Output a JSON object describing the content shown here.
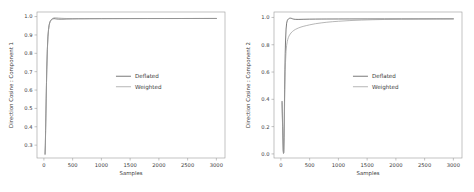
{
  "figure": {
    "background": "#ffffff",
    "panel_count": 2
  },
  "chart_data": [
    {
      "type": "line",
      "title": "",
      "xlabel": "Samples",
      "ylabel": "Direction Cosine : Component 1",
      "xlim": [
        -120,
        3150
      ],
      "ylim": [
        0.23,
        1.025
      ],
      "xticks": [
        0,
        500,
        1000,
        1500,
        2000,
        2500,
        3000
      ],
      "xticklabels": [
        "0",
        "500",
        "1000",
        "1500",
        "2000",
        "2500",
        "3000"
      ],
      "yticks": [
        0.3,
        0.4,
        0.5,
        0.6,
        0.7,
        0.8,
        0.9,
        1.0
      ],
      "yticklabels": [
        "0.3",
        "0.4",
        "0.5",
        "0.6",
        "0.7",
        "0.8",
        "0.9",
        "1.0"
      ],
      "grid": false,
      "legend_position": "center",
      "series": [
        {
          "name": "Deflated",
          "color": "#4d4d4d",
          "x": [
            20,
            25,
            30,
            35,
            40,
            45,
            50,
            60,
            70,
            80,
            90,
            100,
            110,
            120,
            130,
            140,
            150,
            175,
            200,
            225,
            250,
            300,
            350,
            400,
            500,
            600,
            700,
            800,
            1000,
            1200,
            1500,
            1800,
            2100,
            2400,
            2700,
            3000
          ],
          "y": [
            0.252,
            0.3,
            0.381,
            0.47,
            0.556,
            0.64,
            0.714,
            0.822,
            0.89,
            0.929,
            0.952,
            0.966,
            0.974,
            0.979,
            0.983,
            0.985,
            0.987,
            0.989,
            0.988,
            0.987,
            0.9865,
            0.9862,
            0.9865,
            0.987,
            0.9875,
            0.988,
            0.9882,
            0.9885,
            0.9888,
            0.989,
            0.9892,
            0.9894,
            0.9895,
            0.9896,
            0.9897,
            0.9898
          ]
        },
        {
          "name": "Weighted",
          "color": "#9e9e9e",
          "x": [
            20,
            25,
            30,
            35,
            40,
            45,
            50,
            60,
            70,
            80,
            90,
            100,
            110,
            120,
            130,
            140,
            150,
            175,
            200,
            225,
            250,
            300,
            350,
            400,
            500,
            600,
            700,
            800,
            1000,
            1200,
            1500,
            1800,
            2100,
            2400,
            2700,
            3000
          ],
          "y": [
            0.248,
            0.296,
            0.376,
            0.464,
            0.55,
            0.634,
            0.708,
            0.817,
            0.886,
            0.926,
            0.95,
            0.964,
            0.973,
            0.979,
            0.984,
            0.987,
            0.99,
            0.993,
            0.9935,
            0.993,
            0.992,
            0.9908,
            0.99,
            0.9896,
            0.9892,
            0.989,
            0.9889,
            0.9889,
            0.989,
            0.9891,
            0.9893,
            0.9894,
            0.9895,
            0.9896,
            0.9897,
            0.9898
          ]
        }
      ]
    },
    {
      "type": "line",
      "title": "",
      "xlabel": "Samples",
      "ylabel": "Direction Cosine : Component 2",
      "xlim": [
        -120,
        3150
      ],
      "ylim": [
        -0.03,
        1.04
      ],
      "xticks": [
        0,
        500,
        1000,
        1500,
        2000,
        2500,
        3000
      ],
      "xticklabels": [
        "0",
        "500",
        "1000",
        "1500",
        "2000",
        "2500",
        "3000"
      ],
      "yticks": [
        0.0,
        0.2,
        0.4,
        0.6,
        0.8,
        1.0
      ],
      "yticklabels": [
        "0.0",
        "0.2",
        "0.4",
        "0.6",
        "0.8",
        "1.0"
      ],
      "grid": false,
      "legend_position": "center",
      "series": [
        {
          "name": "Deflated",
          "color": "#4d4d4d",
          "x": [
            20,
            30,
            40,
            45,
            50,
            55,
            60,
            65,
            70,
            75,
            80,
            90,
            100,
            110,
            120,
            130,
            140,
            150,
            165,
            180,
            200,
            225,
            250,
            300,
            350,
            400,
            500,
            600,
            700,
            800,
            1000,
            1200,
            1500,
            1800,
            2100,
            2400,
            2700,
            3000
          ],
          "y": [
            0.385,
            0.2,
            0.03,
            0.005,
            0.012,
            0.12,
            0.3,
            0.47,
            0.62,
            0.735,
            0.82,
            0.915,
            0.958,
            0.976,
            0.984,
            0.989,
            0.992,
            0.994,
            0.9948,
            0.9938,
            0.9905,
            0.9875,
            0.9862,
            0.9858,
            0.9862,
            0.9868,
            0.9876,
            0.9881,
            0.9884,
            0.9886,
            0.9889,
            0.9891,
            0.9893,
            0.9894,
            0.9895,
            0.9896,
            0.9897,
            0.9898
          ]
        },
        {
          "name": "Weighted",
          "color": "#9e9e9e",
          "x": [
            20,
            30,
            40,
            45,
            50,
            55,
            60,
            65,
            70,
            75,
            80,
            90,
            100,
            110,
            120,
            130,
            140,
            150,
            175,
            200,
            225,
            250,
            300,
            350,
            400,
            450,
            500,
            600,
            700,
            800,
            900,
            1000,
            1200,
            1400,
            1600,
            1800,
            2100,
            2400,
            2700,
            3000
          ],
          "y": [
            0.375,
            0.19,
            0.022,
            0.002,
            0.008,
            0.095,
            0.245,
            0.39,
            0.51,
            0.605,
            0.672,
            0.752,
            0.796,
            0.822,
            0.84,
            0.853,
            0.863,
            0.871,
            0.886,
            0.897,
            0.905,
            0.912,
            0.922,
            0.93,
            0.936,
            0.941,
            0.946,
            0.954,
            0.96,
            0.965,
            0.969,
            0.972,
            0.9772,
            0.9808,
            0.9834,
            0.9853,
            0.9872,
            0.9884,
            0.9892,
            0.9898
          ]
        }
      ]
    }
  ]
}
